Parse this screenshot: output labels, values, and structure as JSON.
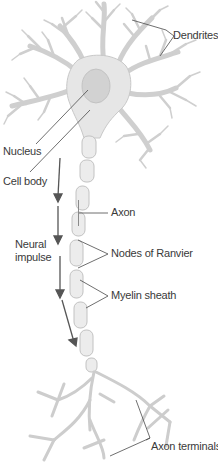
{
  "diagram": {
    "labels": {
      "dendrites": "Dendrites",
      "nucleus": "Nucleus",
      "cell_body": "Cell body",
      "axon": "Axon",
      "neural_impulse_line1": "Neural",
      "neural_impulse_line2": "impulse",
      "nodes_of_ranvier": "Nodes of Ranvier",
      "myelin_sheath": "Myelin sheath",
      "axon_terminals": "Axon terminals"
    },
    "colors": {
      "cell_fill": "#e6e6e6",
      "cell_stroke": "#c4c4c4",
      "nucleus_fill": "#d2d2d2",
      "leader_line": "#4a4a4a",
      "arrow": "#555555",
      "text": "#3a3a3a"
    }
  }
}
